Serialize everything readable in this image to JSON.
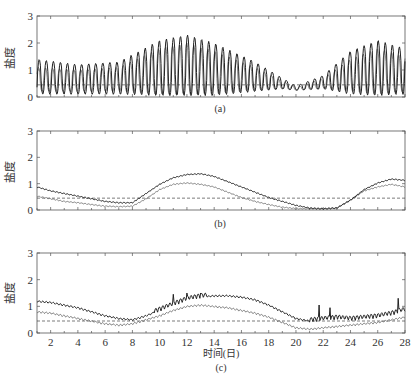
{
  "figure": {
    "xlabel": "时间(日)",
    "ylabel": "盐度",
    "xticks": [
      2,
      4,
      6,
      8,
      10,
      12,
      14,
      16,
      18,
      20,
      22,
      24,
      26,
      28
    ],
    "yticks": [
      0,
      1,
      2,
      3
    ]
  },
  "chart_data": [
    {
      "type": "line",
      "panel_label": "(a)",
      "title": "",
      "xlabel": "",
      "ylabel": "盐度",
      "xlim": [
        1,
        28
      ],
      "ylim": [
        0,
        3
      ],
      "reference_line": {
        "y": 0.45,
        "style": "dashed"
      },
      "series": [
        {
          "name": "salinity-dark",
          "description": "strongly oscillating tidal salinity, spring-neap envelope",
          "envelope_x": [
            1,
            4,
            7,
            10,
            12,
            14,
            17,
            19,
            20,
            22,
            24,
            26,
            28
          ],
          "envelope_max": [
            1.4,
            1.2,
            1.3,
            2.1,
            2.3,
            2.0,
            1.3,
            0.7,
            0.4,
            0.8,
            1.7,
            2.1,
            1.8
          ],
          "envelope_min": [
            0.1,
            0.1,
            0.1,
            0.05,
            0.05,
            0.05,
            0.2,
            0.3,
            0.25,
            0.3,
            0.1,
            0.05,
            0.1
          ]
        },
        {
          "name": "salinity-light",
          "description": "secondary oscillating salinity series",
          "envelope_x": [
            1,
            4,
            7,
            10,
            12,
            14,
            17,
            19,
            20,
            22,
            24,
            26,
            28
          ],
          "envelope_max": [
            1.1,
            1.0,
            1.1,
            1.8,
            2.0,
            1.7,
            1.1,
            0.6,
            0.35,
            0.7,
            1.4,
            1.8,
            1.5
          ],
          "envelope_min": [
            0.2,
            0.2,
            0.2,
            0.1,
            0.1,
            0.1,
            0.25,
            0.3,
            0.25,
            0.3,
            0.2,
            0.1,
            0.2
          ]
        }
      ]
    },
    {
      "type": "line",
      "panel_label": "(b)",
      "title": "",
      "xlabel": "",
      "ylabel": "盐度",
      "xlim": [
        1,
        28
      ],
      "ylim": [
        0,
        3
      ],
      "reference_line": {
        "y": 0.45,
        "style": "dashed"
      },
      "series": [
        {
          "name": "salinity-upper",
          "x": [
            1,
            2,
            3,
            4,
            5,
            6,
            7,
            8,
            9,
            10,
            11,
            12,
            13,
            14,
            15,
            16,
            17,
            18,
            19,
            20,
            21,
            22,
            23,
            24,
            25,
            26,
            27,
            28
          ],
          "values": [
            0.85,
            0.7,
            0.6,
            0.5,
            0.4,
            0.3,
            0.25,
            0.25,
            0.6,
            0.95,
            1.2,
            1.32,
            1.35,
            1.25,
            1.05,
            0.85,
            0.65,
            0.45,
            0.3,
            0.15,
            0.05,
            0.02,
            0.05,
            0.35,
            0.75,
            1.0,
            1.15,
            1.1
          ]
        },
        {
          "name": "salinity-lower",
          "x": [
            1,
            2,
            3,
            4,
            5,
            6,
            7,
            8,
            9,
            10,
            11,
            12,
            13,
            14,
            15,
            16,
            17,
            18,
            19,
            20,
            21,
            22,
            23,
            24,
            25,
            26,
            27,
            28
          ],
          "values": [
            0.5,
            0.4,
            0.3,
            0.25,
            0.18,
            0.12,
            0.1,
            0.12,
            0.4,
            0.75,
            0.95,
            1.0,
            0.95,
            0.85,
            0.65,
            0.45,
            0.3,
            0.18,
            0.08,
            0.03,
            0.02,
            0.02,
            0.05,
            0.35,
            0.7,
            0.85,
            0.95,
            0.85
          ]
        }
      ]
    },
    {
      "type": "line",
      "panel_label": "(c)",
      "title": "",
      "xlabel": "时间(日)",
      "ylabel": "盐度",
      "xlim": [
        1,
        28
      ],
      "ylim": [
        0,
        3
      ],
      "reference_line": {
        "y": 0.45,
        "style": "dashed"
      },
      "series": [
        {
          "name": "salinity-upper",
          "x": [
            1,
            2,
            3,
            4,
            5,
            6,
            7,
            8,
            9,
            10,
            11,
            12,
            13,
            14,
            15,
            16,
            17,
            18,
            19,
            20,
            21,
            22,
            23,
            24,
            25,
            26,
            27,
            28
          ],
          "values": [
            1.15,
            1.1,
            1.0,
            0.9,
            0.75,
            0.6,
            0.5,
            0.45,
            0.6,
            0.8,
            1.0,
            1.2,
            1.3,
            1.35,
            1.35,
            1.3,
            1.2,
            1.0,
            0.75,
            0.5,
            0.4,
            0.45,
            0.5,
            0.45,
            0.5,
            0.55,
            0.65,
            0.8
          ],
          "peaks": [
            [
              11,
              1.45
            ],
            [
              12,
              1.5
            ],
            [
              13,
              1.5
            ],
            [
              21.7,
              1.05
            ],
            [
              22.5,
              0.95
            ],
            [
              27.5,
              1.3
            ]
          ]
        },
        {
          "name": "salinity-lower",
          "x": [
            1,
            2,
            3,
            4,
            5,
            6,
            7,
            8,
            9,
            10,
            11,
            12,
            13,
            14,
            15,
            16,
            17,
            18,
            19,
            20,
            21,
            22,
            23,
            24,
            25,
            26,
            27,
            28
          ],
          "values": [
            0.75,
            0.7,
            0.6,
            0.5,
            0.4,
            0.3,
            0.25,
            0.3,
            0.45,
            0.6,
            0.8,
            0.95,
            1.0,
            0.95,
            0.9,
            0.8,
            0.7,
            0.55,
            0.35,
            0.15,
            0.1,
            0.15,
            0.2,
            0.25,
            0.3,
            0.35,
            0.45,
            0.55
          ]
        }
      ]
    }
  ]
}
